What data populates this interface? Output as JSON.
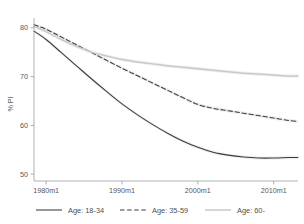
{
  "chart_data": {
    "type": "line",
    "title": "",
    "xlabel": "",
    "ylabel": "% PI",
    "xlim": [
      1978.4,
      2013.2
    ],
    "ylim": [
      48.6,
      82.0
    ],
    "grid": false,
    "legend_position": "bottom",
    "x_tick_labels": [
      "1980m1",
      "1990m1",
      "2000m1",
      "2010m1"
    ],
    "x_tick_values": [
      1980,
      1990,
      2000,
      2010
    ],
    "y_tick_labels": [
      "50",
      "60",
      "70",
      "80"
    ],
    "y_tick_values": [
      50,
      60,
      70,
      80
    ],
    "series": [
      {
        "name": "Age: 18-34",
        "style": "solid",
        "color": "#3b3b3b",
        "x": [
          1978.4,
          1980,
          1982,
          1984,
          1986,
          1988,
          1990,
          1992,
          1994,
          1996,
          1998,
          2000,
          2002,
          2004,
          2006,
          2008,
          2010,
          2012,
          2013.2
        ],
        "values": [
          79.3,
          77.6,
          74.9,
          72.2,
          69.5,
          66.9,
          64.4,
          62.2,
          60.2,
          58.4,
          56.8,
          55.5,
          54.5,
          53.9,
          53.5,
          53.3,
          53.3,
          53.4,
          53.4
        ]
      },
      {
        "name": "Age: 35-59",
        "style": "dashed",
        "color": "#3b3b3b",
        "x": [
          1978.4,
          1980,
          1982,
          1984,
          1986,
          1988,
          1990,
          1992,
          1994,
          1996,
          1998,
          2000,
          2002,
          2004,
          2006,
          2008,
          2010,
          2012,
          2013.2
        ],
        "values": [
          80.6,
          79.7,
          78.1,
          76.5,
          74.9,
          73.3,
          71.7,
          70.2,
          68.7,
          67.2,
          65.7,
          64.3,
          63.5,
          63.0,
          62.5,
          62.0,
          61.5,
          61.0,
          60.8
        ]
      },
      {
        "name": "Age: 60-",
        "style": "solid",
        "color": "#c9c9c9",
        "x": [
          1978.4,
          1980,
          1982,
          1984,
          1986,
          1988,
          1990,
          1992,
          1994,
          1996,
          1998,
          2000,
          2002,
          2004,
          2006,
          2008,
          2010,
          2012,
          2013.2
        ],
        "values": [
          80.3,
          79.2,
          77.6,
          76.2,
          75.0,
          74.2,
          73.5,
          73.0,
          72.6,
          72.2,
          71.9,
          71.6,
          71.3,
          71.0,
          70.7,
          70.5,
          70.3,
          70.1,
          70.1
        ]
      }
    ],
    "legend_entries": [
      {
        "label": "Age: 18-34",
        "style": "solid",
        "color": "#3b3b3b"
      },
      {
        "label": "Age: 35-59",
        "style": "dashed",
        "color": "#3b3b3b"
      },
      {
        "label": "Age: 60-",
        "style": "solid",
        "color": "#c9c9c9"
      }
    ]
  }
}
